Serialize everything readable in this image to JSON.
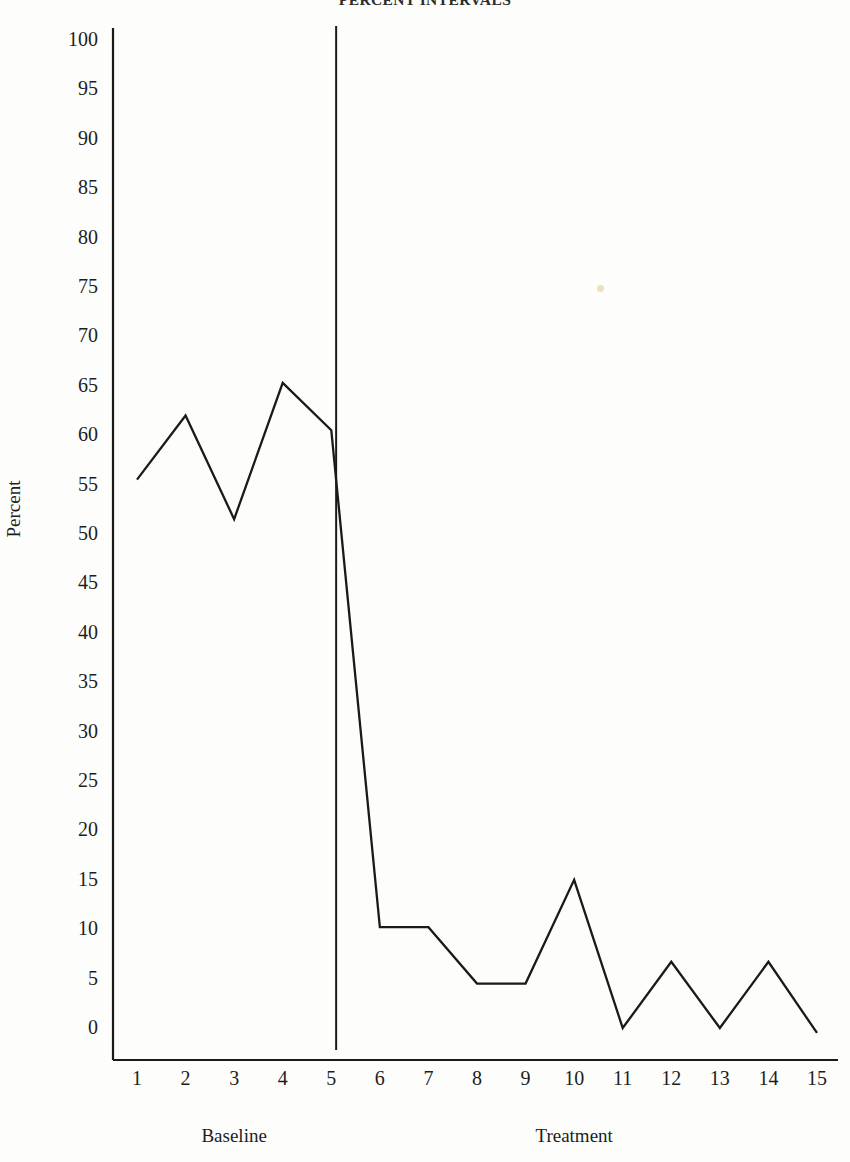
{
  "chart_data": {
    "type": "line",
    "title": "PERCENT INTERVALS",
    "xlabel": "",
    "ylabel": "Percent",
    "x": [
      1,
      2,
      3,
      4,
      5,
      6,
      7,
      8,
      9,
      10,
      11,
      12,
      13,
      14,
      15
    ],
    "categories": [
      "1",
      "2",
      "3",
      "4",
      "5",
      "6",
      "7",
      "8",
      "9",
      "10",
      "11",
      "12",
      "13",
      "14",
      "15"
    ],
    "values": [
      55.5,
      62.0,
      51.5,
      65.3,
      60.5,
      10.2,
      10.2,
      4.5,
      4.5,
      15.0,
      0.0,
      6.7,
      0.0,
      6.7,
      -0.5
    ],
    "series": [
      {
        "name": "Percent",
        "values": [
          55.5,
          62.0,
          51.5,
          65.3,
          60.5,
          10.2,
          10.2,
          4.5,
          4.5,
          15.0,
          0.0,
          6.7,
          0.0,
          6.7,
          -0.5
        ]
      }
    ],
    "ylim": [
      0,
      100
    ],
    "yticks": [
      0,
      5,
      10,
      15,
      20,
      25,
      30,
      35,
      40,
      45,
      50,
      55,
      60,
      65,
      70,
      75,
      80,
      85,
      90,
      95,
      100
    ],
    "ytick_labels": [
      "0",
      "5",
      "10",
      "15",
      "20",
      "25",
      "30",
      "35",
      "40",
      "45",
      "50",
      "55",
      "60",
      "65",
      "70",
      "75",
      "80",
      "85",
      "90",
      "95",
      "100"
    ],
    "xlim": [
      1,
      15
    ],
    "grid": false,
    "legend": null,
    "line_color": "#1a1a1a",
    "axis_color": "#1a1a1a",
    "background_color": "#fdfdfb",
    "phases": [
      {
        "name": "Baseline",
        "label": "Baseline",
        "x_start": 1,
        "x_end": 5
      },
      {
        "name": "Treatment",
        "label": "Treatment",
        "x_start": 5,
        "x_end": 15
      }
    ],
    "phase_divider_x": 5.1,
    "annotations": []
  }
}
